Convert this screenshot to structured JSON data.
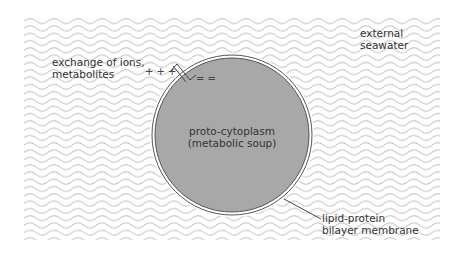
{
  "diagram": {
    "colors": {
      "background": "#ffffff",
      "wave": "#c8c8c8",
      "cytoplasm": "#a8a8a8",
      "membrane_line": "#555555",
      "text": "#333333"
    },
    "labels": {
      "exchange_line1": "exchange of ions,",
      "exchange_line2": "metabolites",
      "seawater_line1": "external",
      "seawater_line2": "seawater",
      "cytoplasm_line1": "proto-cytoplasm",
      "cytoplasm_line2": "(metabolic soup)",
      "membrane_line1": "lipid-protein",
      "membrane_line2": "bilayer membrane"
    },
    "symbols": {
      "positive_charges": "+ + +",
      "negative_charges": "= ="
    },
    "cell": {
      "cx": 232,
      "cy": 135,
      "r": 79
    }
  }
}
